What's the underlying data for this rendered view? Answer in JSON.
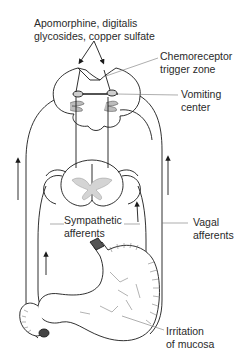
{
  "diagram": {
    "type": "anatomical-pathway",
    "labels": {
      "stimulus": {
        "line1": "Apomorphine, digitalis",
        "line2": "glycosides, copper sulfate"
      },
      "ctz": {
        "line1": "Chemoreceptor",
        "line2": "trigger zone"
      },
      "vomiting_center": {
        "line1": "Vomiting",
        "line2": "center"
      },
      "sympathetic": {
        "line1": "Sympathetic",
        "line2": "afferents"
      },
      "vagal": {
        "line1": "Vagal",
        "line2": "afferents"
      },
      "mucosa": {
        "line1": "Irritation",
        "line2": "of mucosa"
      }
    },
    "structures": [
      "brainstem-medulla",
      "spinal-cord-cross-section",
      "stomach",
      "duodenum",
      "esophagus"
    ],
    "colors": {
      "line": "#1a1a1a",
      "leader": "#777777",
      "shading": "#999999"
    }
  }
}
